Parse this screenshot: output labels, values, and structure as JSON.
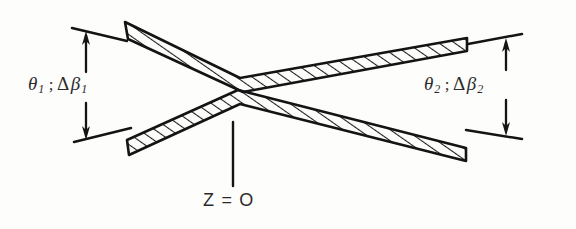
{
  "figure": {
    "background_color": "#fdfdfc",
    "ink_color": "#1a1a1a"
  },
  "labels": {
    "left_angle": {
      "theta_symbol": "θ",
      "theta_subscript": "1",
      "separator": ";",
      "delta_symbol": "Δ",
      "beta_symbol": "β",
      "beta_subscript": "1",
      "full_text": "θ₁ ; Δβ₁"
    },
    "right_angle": {
      "theta_symbol": "θ",
      "theta_subscript": "2",
      "separator": ";",
      "delta_symbol": "Δ",
      "beta_symbol": "β",
      "beta_subscript": "2",
      "full_text": "θ₂ ; Δβ₂"
    },
    "origin_marker": {
      "text": "Z = O",
      "points_to": "beam crossing waist"
    }
  },
  "geometry": {
    "crossing_point": {
      "x": 237,
      "y": 83
    },
    "upper_band": {
      "left_end_x": 125,
      "left_end_y": 22,
      "right_end_x": 467,
      "right_end_y": 38,
      "description": "hatched band descending left-to-right then ascending"
    },
    "lower_band": {
      "left_end_x": 127,
      "left_end_y": 155,
      "right_end_x": 466,
      "right_end_y": 148,
      "description": "hatched band ascending left-to-right then descending"
    },
    "left_dimension_arrow": {
      "x": 86,
      "top_y": 33,
      "bottom_y": 137
    },
    "right_dimension_arrow": {
      "x": 506,
      "top_y": 41,
      "bottom_y": 133
    },
    "origin_leader_line": {
      "x": 233,
      "top_y": 122,
      "bottom_y": 186
    }
  },
  "style": {
    "hatch_spacing_px": 9,
    "hatch_angle_deg": 60,
    "stroke_width_px": 2.4
  }
}
